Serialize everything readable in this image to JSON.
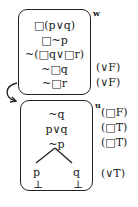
{
  "world_w": {
    "name": "w",
    "lines": [
      "□(p∨q)",
      "□~p",
      "~(□q∨□r)",
      "~□q",
      "~□r"
    ],
    "annotations": [
      "",
      "",
      "",
      "(∨F)",
      "(∨F)"
    ]
  },
  "world_u": {
    "name": "u",
    "lines": [
      "~q",
      "p∨q",
      "~p"
    ],
    "annotations": [
      "(□F)",
      "(□T)",
      "(□T)"
    ],
    "branches": [
      {
        "atom": "p",
        "closed": "⊥"
      },
      {
        "atom": "q",
        "closed": "⊥"
      }
    ],
    "branch_annotation": "(∨T)"
  }
}
